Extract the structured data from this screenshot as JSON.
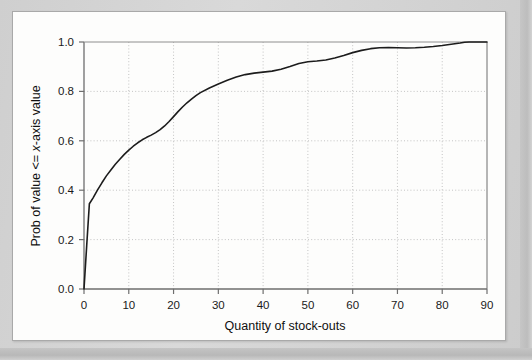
{
  "figure": {
    "background_color": "#d4d4d4",
    "card_color": "#fdfdfc",
    "border_color": "#a9a9a9"
  },
  "axis": {
    "x_title": "Quantity of stock-outs",
    "y_title_part1": "Prob of value <= ",
    "y_title_italic": "x",
    "y_title_part2": "-axis value",
    "y_title_full": "Prob of value <= x-axis value",
    "x_ticks": [
      "0",
      "10",
      "20",
      "30",
      "40",
      "50",
      "60",
      "70",
      "80",
      "90"
    ],
    "y_ticks": [
      "0.0",
      "0.2",
      "0.4",
      "0.6",
      "0.8",
      "1.0"
    ]
  },
  "chart_data": {
    "type": "line",
    "title": "",
    "xlabel": "Quantity of stock-outs",
    "ylabel": "Prob of value <= x-axis value",
    "xlim": [
      0,
      90
    ],
    "ylim": [
      0.0,
      1.0
    ],
    "xticks": [
      0,
      10,
      20,
      30,
      40,
      50,
      60,
      70,
      80,
      90
    ],
    "yticks": [
      0.0,
      0.2,
      0.4,
      0.6,
      0.8,
      1.0
    ],
    "grid": "dotted-both-axes",
    "legend": "none",
    "line_color": "#1c1c1c",
    "line_width": 1.6,
    "series": [
      {
        "name": "Cumulative probability of stock-outs",
        "x": [
          0,
          0.6,
          1.2,
          2,
          3,
          4,
          5,
          6,
          7,
          8,
          9,
          10,
          11,
          12,
          13,
          14,
          15,
          16,
          17,
          18,
          19,
          20,
          21,
          22,
          23,
          24,
          25,
          26,
          28,
          30,
          32,
          34,
          36,
          38,
          40,
          42,
          44,
          46,
          48,
          50,
          52,
          54,
          56,
          58,
          60,
          62,
          64,
          66,
          68,
          70,
          72,
          74,
          76,
          78,
          80,
          82,
          84,
          85,
          86,
          88,
          90
        ],
        "y": [
          0.0,
          0.175,
          0.345,
          0.368,
          0.4,
          0.43,
          0.458,
          0.482,
          0.505,
          0.525,
          0.545,
          0.562,
          0.578,
          0.592,
          0.604,
          0.614,
          0.623,
          0.633,
          0.645,
          0.66,
          0.678,
          0.698,
          0.718,
          0.737,
          0.754,
          0.769,
          0.783,
          0.795,
          0.814,
          0.83,
          0.845,
          0.858,
          0.868,
          0.874,
          0.878,
          0.882,
          0.89,
          0.901,
          0.913,
          0.92,
          0.923,
          0.927,
          0.935,
          0.945,
          0.957,
          0.966,
          0.973,
          0.977,
          0.978,
          0.977,
          0.976,
          0.977,
          0.979,
          0.982,
          0.986,
          0.991,
          0.996,
          0.999,
          1.0,
          1.0,
          1.0
        ]
      }
    ]
  }
}
